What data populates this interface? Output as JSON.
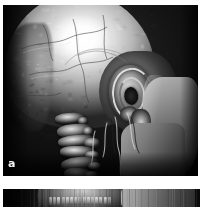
{
  "figure": {
    "background_color": "#ffffff",
    "modality": "3D volume-rendered CT reconstruction",
    "panels": [
      {
        "id": "panel-a",
        "label": "a",
        "label_color": "#f2f2f2",
        "background_color": "#050505",
        "view": "lateral",
        "description": "Lateral 3D CT volume rendering of the skull showing the cranial vault, external ear, mandibular ramus, cervical vertebrae and neck vessels",
        "structures": [
          "cranial vault",
          "parietal bone highlight",
          "occipital region",
          "temporal region",
          "auricle",
          "helix",
          "antihelix",
          "concha",
          "lobule",
          "mastoid process",
          "mandibular ramus",
          "cervical vertebrae",
          "neck vessels"
        ]
      },
      {
        "id": "panel-b",
        "label": "",
        "background_color": "#070707",
        "view": "cropped",
        "description": "Partially visible lower figure panel, cropped at the bottom edge of the image, showing jaw and dentition region"
      }
    ]
  }
}
